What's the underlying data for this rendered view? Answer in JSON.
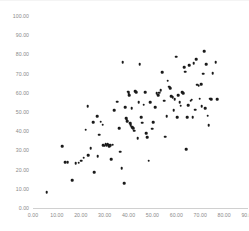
{
  "chart_data": {
    "type": "scatter",
    "title": "",
    "xlabel": "",
    "ylabel": "",
    "xlim": [
      0,
      90
    ],
    "ylim": [
      0,
      100
    ],
    "xticks": [
      "0.00",
      "10.00",
      "20.00",
      "30.00",
      "40.00",
      "50.00",
      "60.00",
      "70.00",
      "80.00",
      "90.00"
    ],
    "yticks": [
      "0.00",
      "10.00",
      "20.00",
      "30.00",
      "40.00",
      "50.00",
      "60.00",
      "70.00",
      "80.00",
      "90.00",
      "100.00"
    ],
    "xtick_values": [
      0,
      10,
      20,
      30,
      40,
      50,
      60,
      70,
      80,
      90
    ],
    "ytick_values": [
      0,
      10,
      20,
      30,
      40,
      50,
      60,
      70,
      80,
      90,
      100
    ],
    "grid": false,
    "legend": false,
    "marker_color": "#1a1a1a",
    "marker_shape": "circle",
    "axis_color": "#d0d0d0",
    "tick_label_color": "#8a8a8a",
    "n_points": 116,
    "points": [
      [
        5.7,
        8.3
      ],
      [
        12.3,
        32.3
      ],
      [
        13.6,
        23.8
      ],
      [
        14.5,
        23.9
      ],
      [
        16.3,
        14.6
      ],
      [
        17.9,
        23.4
      ],
      [
        19.2,
        23.5
      ],
      [
        20.3,
        24.6
      ],
      [
        21.3,
        26.1
      ],
      [
        22.1,
        40.8
      ],
      [
        22.9,
        53.1
      ],
      [
        23.2,
        27.6
      ],
      [
        24.2,
        31.0
      ],
      [
        25.1,
        44.8
      ],
      [
        25.6,
        18.5
      ],
      [
        26.8,
        47.8
      ],
      [
        27.1,
        26.9
      ],
      [
        27.8,
        38.2
      ],
      [
        28.3,
        44.9
      ],
      [
        29.2,
        43.3
      ],
      [
        29.5,
        32.6
      ],
      [
        30.1,
        32.4
      ],
      [
        30.4,
        33.1
      ],
      [
        30.8,
        32.8
      ],
      [
        31.2,
        33.4
      ],
      [
        31.6,
        33.0
      ],
      [
        31.9,
        32.2
      ],
      [
        32.4,
        32.8
      ],
      [
        32.8,
        25.4
      ],
      [
        33.4,
        32.9
      ],
      [
        34.1,
        50.8
      ],
      [
        35.3,
        55.4
      ],
      [
        36.0,
        41.6
      ],
      [
        36.6,
        29.4
      ],
      [
        37.2,
        20.8
      ],
      [
        37.6,
        75.9
      ],
      [
        38.1,
        12.9
      ],
      [
        38.5,
        52.4
      ],
      [
        38.9,
        46.9
      ],
      [
        39.2,
        46.0
      ],
      [
        39.5,
        45.3
      ],
      [
        39.8,
        60.6
      ],
      [
        40.0,
        59.8
      ],
      [
        40.3,
        58.8
      ],
      [
        40.6,
        44.2
      ],
      [
        40.9,
        43.1
      ],
      [
        41.3,
        52.0
      ],
      [
        41.6,
        42.2
      ],
      [
        42.0,
        41.5
      ],
      [
        42.3,
        40.3
      ],
      [
        42.7,
        60.9
      ],
      [
        43.3,
        60.2
      ],
      [
        43.9,
        36.5
      ],
      [
        44.2,
        55.2
      ],
      [
        44.6,
        75.0
      ],
      [
        45.2,
        47.2
      ],
      [
        45.8,
        44.4
      ],
      [
        46.3,
        53.9
      ],
      [
        46.9,
        60.2
      ],
      [
        47.4,
        39.0
      ],
      [
        47.9,
        36.9
      ],
      [
        48.4,
        24.7
      ],
      [
        49.1,
        55.0
      ],
      [
        49.8,
        41.4
      ],
      [
        50.4,
        44.7
      ],
      [
        51.1,
        52.5
      ],
      [
        51.8,
        59.9
      ],
      [
        52.3,
        58.6
      ],
      [
        52.9,
        60.1
      ],
      [
        53.5,
        61.5
      ],
      [
        54.2,
        70.7
      ],
      [
        54.8,
        55.9
      ],
      [
        55.3,
        37.1
      ],
      [
        55.9,
        47.8
      ],
      [
        56.4,
        66.4
      ],
      [
        56.9,
        63.1
      ],
      [
        57.4,
        62.3
      ],
      [
        57.9,
        58.3
      ],
      [
        58.4,
        57.6
      ],
      [
        58.9,
        51.0
      ],
      [
        59.4,
        56.8
      ],
      [
        59.9,
        78.8
      ],
      [
        60.4,
        47.2
      ],
      [
        60.9,
        58.7
      ],
      [
        61.4,
        55.2
      ],
      [
        61.9,
        53.2
      ],
      [
        62.4,
        60.3
      ],
      [
        62.9,
        59.8
      ],
      [
        63.4,
        73.3
      ],
      [
        63.8,
        71.0
      ],
      [
        64.2,
        30.7
      ],
      [
        64.6,
        47.2
      ],
      [
        65.0,
        53.4
      ],
      [
        65.5,
        74.5
      ],
      [
        66.0,
        55.8
      ],
      [
        66.4,
        56.4
      ],
      [
        66.9,
        47.4
      ],
      [
        67.3,
        75.4
      ],
      [
        67.8,
        51.2
      ],
      [
        68.3,
        77.5
      ],
      [
        68.8,
        64.2
      ],
      [
        69.3,
        63.8
      ],
      [
        69.8,
        56.9
      ],
      [
        70.3,
        64.6
      ],
      [
        70.7,
        53.1
      ],
      [
        71.2,
        70.0
      ],
      [
        71.6,
        81.6
      ],
      [
        72.1,
        52.1
      ],
      [
        72.6,
        74.9
      ],
      [
        73.1,
        48.1
      ],
      [
        73.6,
        43.2
      ],
      [
        74.1,
        56.9
      ],
      [
        74.6,
        56.6
      ],
      [
        75.2,
        70.3
      ],
      [
        76.4,
        75.8
      ],
      [
        77.0,
        56.7
      ]
    ]
  }
}
